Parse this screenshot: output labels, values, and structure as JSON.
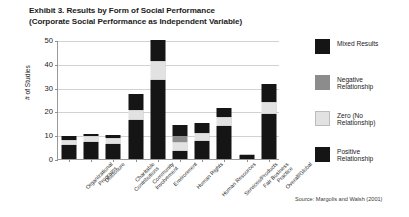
{
  "title": {
    "line1": "Exhibit 3. Results by Form of Social Performance",
    "line2": "(Corporate Social Performance as Independent Variable)"
  },
  "source": "Source: Margolis and Walsh (2001)",
  "axis": {
    "ylabel": "# of Studies",
    "yticks": [
      "0",
      "10",
      "20",
      "30",
      "40",
      "50"
    ],
    "ymin": 0,
    "ymax": 50
  },
  "legend": {
    "items": [
      {
        "label_line1": "Mixed Results",
        "label_line2": "",
        "color": "#151515",
        "name": "mixed-results"
      },
      {
        "label_line1": "Negative",
        "label_line2": "Relationship",
        "color": "#8c8c8c",
        "name": "negative-relationship"
      },
      {
        "label_line1": "Zero (No",
        "label_line2": "Relationship)",
        "color": "#e2e2e2",
        "name": "zero-relationship"
      },
      {
        "label_line1": "Positive",
        "label_line2": "Relationship",
        "color": "#151515",
        "name": "positive-relationship"
      }
    ]
  },
  "chart_data": {
    "type": "bar",
    "subtype": "stacked-vertical",
    "title": "Exhibit 3. Results by Form of Social Performance (Corporate Social Performance as Independent Variable)",
    "xlabel": "",
    "ylabel": "# of Studies",
    "ylim": [
      0,
      50
    ],
    "yticks": [
      0,
      10,
      20,
      30,
      40,
      50
    ],
    "grid": true,
    "legend_position": "right",
    "categories": [
      "Organizational Programs",
      "Disclosure",
      "Charitable Contributions",
      "Community Involvement",
      "Environment",
      "Human Rights",
      "Human Resources",
      "Services/Products",
      "Fair Business Practice",
      "Overall/Global"
    ],
    "category_lines": [
      [
        "Organizational",
        "Programs"
      ],
      [
        "Disclosure"
      ],
      [
        "Charitable",
        "Contributions"
      ],
      [
        "Community",
        "Involvement"
      ],
      [
        "Environment"
      ],
      [
        "Human Rights"
      ],
      [
        "Human Resources"
      ],
      [
        "Services/Products"
      ],
      [
        "Fair Business",
        "Practice"
      ],
      [
        "Overall/Global"
      ]
    ],
    "series": [
      {
        "name": "Positive Relationship",
        "color": "#151515",
        "values": [
          6,
          7,
          6.5,
          16.5,
          33,
          3.5,
          7.5,
          14,
          1.5,
          19
        ]
      },
      {
        "name": "Zero (No Relationship)",
        "color": "#e2e2e2",
        "values": [
          2,
          2.5,
          2.5,
          4,
          8,
          3.5,
          3.5,
          3.5,
          0.5,
          5
        ]
      },
      {
        "name": "Negative Relationship",
        "color": "#8c8c8c",
        "values": [
          0,
          0,
          0,
          0,
          0,
          2.5,
          0,
          0,
          0,
          0
        ]
      },
      {
        "name": "Mixed Results",
        "color": "#151515",
        "values": [
          1.5,
          1,
          1,
          7,
          9,
          5,
          4,
          4,
          0,
          7.5
        ]
      }
    ],
    "totals": [
      9.5,
      10.5,
      10,
      27.5,
      50,
      14.5,
      15,
      21.5,
      2,
      31.5
    ]
  }
}
